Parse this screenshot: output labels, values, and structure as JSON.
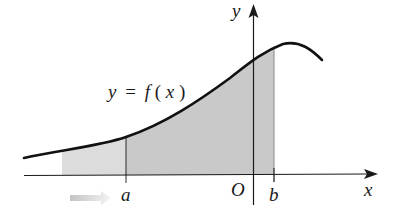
{
  "diagram": {
    "type": "improper-integral-area",
    "curve_label": {
      "y": "y",
      "equals": "=",
      "f": "f",
      "open_paren": "(",
      "x": "x",
      "close_paren": ")"
    },
    "axis_labels": {
      "x_axis": "x",
      "y_axis": "y",
      "origin": "O"
    },
    "bound_labels": {
      "lower": "a",
      "upper": "b"
    },
    "colors": {
      "curve": "#111111",
      "axes": "#1a1a1a",
      "shade_dark": "#c9c9c9",
      "shade_light": "#dcdcdc",
      "arrow_start": "#c8c8c8",
      "arrow_end": "#f2f2f2",
      "background": "#ffffff"
    },
    "annotations": {
      "left_arrow": "indicates a → −∞"
    }
  }
}
